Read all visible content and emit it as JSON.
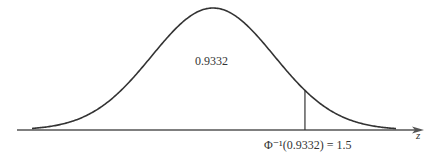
{
  "figure": {
    "title": "",
    "area_label": "0.9332",
    "quantile_label": "Φ⁻¹(0.9332) = 1.5",
    "axis_label": "z"
  },
  "chart_data": {
    "type": "area",
    "xlabel": "z",
    "ylabel": "",
    "distribution": "standard normal",
    "mean": 0,
    "sd": 1,
    "xlim": [
      -3,
      3
    ],
    "annotations": [
      {
        "text": "0.9332",
        "meaning": "area to the left of z = 1.5"
      },
      {
        "text": "Φ⁻¹(0.9332) = 1.5",
        "x": 1.5
      }
    ],
    "marker_x": 1.5,
    "cumulative_probability": 0.9332,
    "grid": false,
    "legend": false
  },
  "colors": {
    "curve": "#333333",
    "axis": "#555555",
    "background": "#ffffff"
  }
}
